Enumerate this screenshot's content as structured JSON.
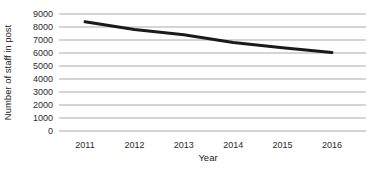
{
  "chart_data": {
    "type": "line",
    "title": "",
    "xlabel": "Year",
    "ylabel": "Number of staff in post",
    "categories": [
      "2011",
      "2012",
      "2013",
      "2014",
      "2015",
      "2016"
    ],
    "series": [
      {
        "name": "Number of staff in post",
        "values": [
          8400,
          7800,
          7400,
          6800,
          6400,
          6050
        ]
      }
    ],
    "ylim": [
      0,
      9000
    ],
    "y_ticks": [
      0,
      1000,
      2000,
      3000,
      4000,
      5000,
      6000,
      7000,
      8000,
      9000
    ],
    "grid": "horizontal",
    "legend_position": "none",
    "colors": {
      "line": "#1a1a1a",
      "gridline": "#ababab",
      "text": "#2b2b2b",
      "background": "#ffffff"
    }
  }
}
